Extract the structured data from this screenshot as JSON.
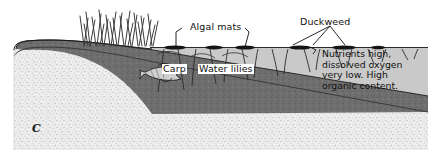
{
  "figure": {
    "panel_letter": "C",
    "type": "cross-section-diagram"
  },
  "labels": {
    "algal_mats": "Algal mats",
    "duckweed": "Duckweed",
    "carp": "Carp",
    "water_lilies": "Water lilies"
  },
  "callout": {
    "text": "Nutrients high,\ndissolved oxygen\nvery low. High\norganic content."
  },
  "colors": {
    "water": "#c9c9c9",
    "organic_sediment": "#6e6e6e",
    "substrate": "#e8e8e8",
    "line": "#1a1a1a",
    "background": "#ffffff"
  },
  "features": {
    "emergent_reeds": "emergent-reeds",
    "fish": "carp-fish",
    "lily_pads": "water-lily-pads",
    "duckweed_patches": "duckweed-patches",
    "algal_mat_patches": "algal-mat-patches"
  }
}
